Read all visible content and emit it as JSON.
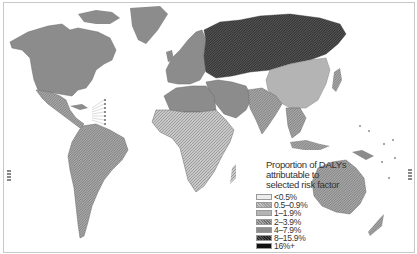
{
  "map": {
    "type": "choropleth world map",
    "measure": "Proportion of DALYs attributable to selected risk factor"
  },
  "legend": {
    "title_lines": [
      "Proportion of DALYs",
      "attributable to",
      "selected risk factor"
    ],
    "items": [
      {
        "label": "<0.5%",
        "color": "#ececec",
        "pattern": "light"
      },
      {
        "label": "0.5–0.9%",
        "color": "#c4c4c4",
        "pattern": "hatch"
      },
      {
        "label": "1–1.9%",
        "color": "#b4b4b4",
        "pattern": "solid"
      },
      {
        "label": "2–3.9%",
        "color": "#a8a8a8",
        "pattern": "hatch"
      },
      {
        "label": "4–7.9%",
        "color": "#8c8c8c",
        "pattern": "solid"
      },
      {
        "label": "8–15.9%",
        "color": "#4a4a4a",
        "pattern": "hatch"
      },
      {
        "label": "16%+",
        "color": "#111111",
        "pattern": "solid"
      }
    ]
  },
  "regions": {
    "north_america": "4–7.9%",
    "greenland": "4–7.9%",
    "mexico_central_america": "2–3.9%",
    "south_america": "2–3.9%",
    "western_europe": "4–7.9%",
    "russia_eastern_europe": "8–15.9%",
    "north_africa": "4–7.9%",
    "sub_saharan_africa": "0.5–0.9%",
    "middle_east": "4–7.9%",
    "south_asia": "2–3.9%",
    "china_mongolia": "1–1.9%",
    "southeast_asia": "2–3.9%",
    "japan": "2–3.9%",
    "australia": "2–3.9%",
    "new_zealand": "2–3.9%",
    "papua_new_guinea": "4–7.9%"
  }
}
